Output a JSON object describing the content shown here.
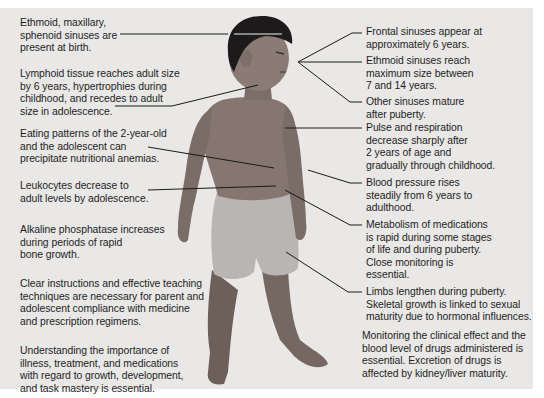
{
  "figure": {
    "colors": {
      "background": "#e9e8e7",
      "page": "#ffffff",
      "text": "#1e1e1e",
      "leader_line": "#1a1a1a",
      "skin": "#7a6c66",
      "hair": "#1c1a1a",
      "shorts": "#b8b5b2"
    }
  },
  "left_labels": [
    {
      "id": "sinuses-birth",
      "text": "Ethmoid, maxillary,\nsphenoid sinuses are\npresent at birth."
    },
    {
      "id": "lymphoid",
      "text": "Lymphoid tissue reaches adult size\nby 6 years, hypertrophies during\nchildhood, and recedes to adult\nsize in adolescence."
    },
    {
      "id": "eating",
      "text": "Eating patterns of the 2-year-old\nand the adolescent can\nprecipitate nutritional anemias."
    },
    {
      "id": "leukocytes",
      "text": "Leukocytes decrease to\nadult levels by adolescence."
    },
    {
      "id": "alkaline",
      "text": "Alkaline phosphatase increases\nduring periods of rapid\nbone growth."
    },
    {
      "id": "instructions",
      "text": "Clear instructions and effective teaching\ntechniques are necessary for parent and\nadolescent compliance with medicine\nand prescription regimens."
    },
    {
      "id": "understanding",
      "text": "Understanding the importance of\nillness, treatment, and medications\nwith regard to growth, development,\nand task mastery is essential."
    }
  ],
  "right_labels": [
    {
      "id": "frontal",
      "text": "Frontal sinuses appear at\napproximately 6 years."
    },
    {
      "id": "ethmoid-max",
      "text": "Ethmoid sinuses reach\nmaximum size between\n7 and 14 years."
    },
    {
      "id": "other-sinuses",
      "text": "Other sinuses mature\nafter puberty."
    },
    {
      "id": "pulse",
      "text": "Pulse and respiration\ndecrease sharply after\n2 years of age and\ngradually through childhood."
    },
    {
      "id": "blood-pressure",
      "text": "Blood pressure rises\nsteadily from 6 years to\nadulthood."
    },
    {
      "id": "metabolism",
      "text": "Metabolism of medications\nis rapid during some stages\nof life and during puberty.\nClose monitoring is\nessential."
    },
    {
      "id": "limbs",
      "text": "Limbs lengthen during puberty.\nSkeletal growth is linked to sexual\nmaturity due to hormonal influences."
    },
    {
      "id": "monitoring",
      "text": "Monitoring the clinical effect and the\nblood level of drugs administered is\nessential. Excretion of drugs is\naffected by kidney/liver maturity."
    }
  ]
}
